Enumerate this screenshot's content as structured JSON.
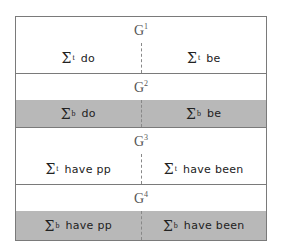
{
  "colors": {
    "border": "#7a7a7a",
    "shaded_row": "#b8b8b8",
    "background": "#ffffff"
  },
  "groups": [
    {
      "label": "G",
      "sup": "1",
      "shaded": false,
      "cells": [
        {
          "symbol": "Σ",
          "sup": "t",
          "text": "do"
        },
        {
          "symbol": "Σ",
          "sup": "t",
          "text": "be"
        }
      ]
    },
    {
      "label": "G",
      "sup": "2",
      "shaded": true,
      "cells": [
        {
          "symbol": "Σ",
          "sup": "b",
          "text": "do"
        },
        {
          "symbol": "Σ",
          "sup": "b",
          "text": "be"
        }
      ]
    },
    {
      "label": "G",
      "sup": "3",
      "shaded": false,
      "cells": [
        {
          "symbol": "Σ",
          "sup": "t",
          "text": "have pp"
        },
        {
          "symbol": "Σ",
          "sup": "t",
          "text": "have been"
        }
      ]
    },
    {
      "label": "G",
      "sup": "4",
      "shaded": true,
      "cells": [
        {
          "symbol": "Σ",
          "sup": "b",
          "text": "have pp"
        },
        {
          "symbol": "Σ",
          "sup": "b",
          "text": "have been"
        }
      ]
    }
  ]
}
